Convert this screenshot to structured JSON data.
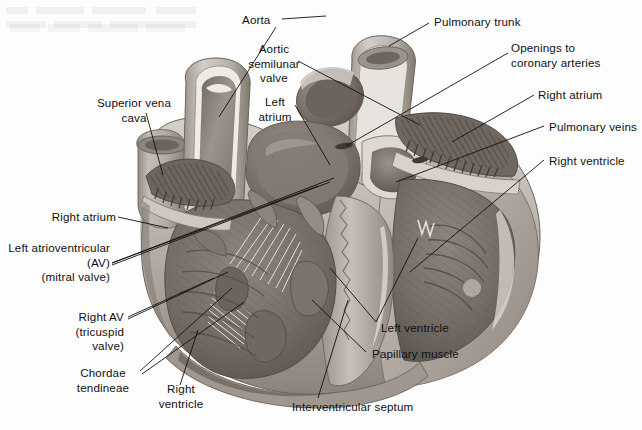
{
  "figure": {
    "style": "grayscale anatomical illustration",
    "width": 642,
    "height": 430,
    "background_color": "#fdfdfd",
    "text_color": "#101010"
  },
  "labels": {
    "aorta": "Aorta",
    "aortic_semilunar_valve": "Aortic\nsemilunar\nvalve",
    "left_atrium": "Left\natrium",
    "superior_vena_cava": "Superior vena\ncava",
    "right_atrium_left": "Right atrium",
    "left_av_mitral": "Left atrioventricular\n(AV)\n(mitral valve)",
    "right_av_tricuspid": "Right AV\n(tricuspid\nvalve)",
    "chordae_tendineae": "Chordae\ntendineae",
    "right_ventricle_bottom": "Right\nventricle",
    "interventricular_septum": "Interventricular septum",
    "papillary_muscle": "Papillary muscle",
    "left_ventricle": "Left ventricle",
    "right_ventricle_right": "Right ventricle",
    "pulmonary_veins": "Pulmonary veins",
    "right_atrium_right": "Right atrium",
    "openings_coronary_arteries": "Openings to\ncoronary arteries",
    "pulmonary_trunk": "Pulmonary trunk"
  },
  "structures": [
    {
      "name": "aorta",
      "side": "top-center"
    },
    {
      "name": "aortic-semilunar-valve",
      "side": "top-center"
    },
    {
      "name": "left-atrium",
      "side": "top-center"
    },
    {
      "name": "superior-vena-cava",
      "side": "left"
    },
    {
      "name": "right-atrium",
      "side": "left"
    },
    {
      "name": "left-atrioventricular-mitral-valve",
      "side": "left"
    },
    {
      "name": "right-av-tricuspid-valve",
      "side": "left"
    },
    {
      "name": "chordae-tendineae",
      "side": "left"
    },
    {
      "name": "right-ventricle",
      "side": "bottom-left"
    },
    {
      "name": "interventricular-septum",
      "side": "bottom"
    },
    {
      "name": "papillary-muscle",
      "side": "bottom-right"
    },
    {
      "name": "left-ventricle",
      "side": "bottom-right"
    },
    {
      "name": "right-ventricle",
      "side": "right"
    },
    {
      "name": "pulmonary-veins",
      "side": "right"
    },
    {
      "name": "right-atrium",
      "side": "right"
    },
    {
      "name": "openings-to-coronary-arteries",
      "side": "top-right"
    },
    {
      "name": "pulmonary-trunk",
      "side": "top-right"
    }
  ],
  "palette": {
    "leader_line": "#111111",
    "myocardium_light": "#cfc9c4",
    "myocardium_mid": "#a9a29c",
    "myocardium_dark": "#6f6862",
    "chamber_dark": "#5b544f",
    "vessel_light": "#e2ddd8",
    "endocardium": "#efebe6"
  }
}
